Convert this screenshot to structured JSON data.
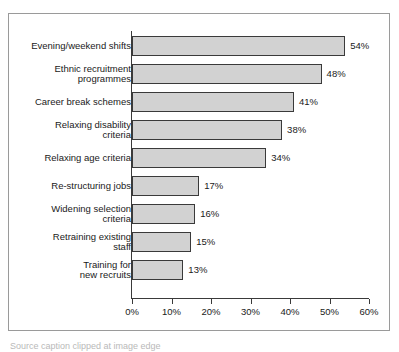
{
  "chart_data": {
    "type": "bar",
    "orientation": "horizontal",
    "title": "",
    "xlabel": "",
    "ylabel": "",
    "categories": [
      "Evening/weekend shifts",
      "Ethnic recruitment\nprogrammes",
      "Career break schemes",
      "Relaxing disability\ncriteria",
      "Relaxing age criteria",
      "Re-structuring jobs",
      "Widening selection\ncriteria",
      "Retraining existing\nstaff",
      "Training for\nnew recruits"
    ],
    "values": [
      54,
      48,
      41,
      38,
      34,
      17,
      16,
      15,
      13
    ],
    "value_labels": [
      "54%",
      "48%",
      "41%",
      "38%",
      "34%",
      "17%",
      "16%",
      "15%",
      "13%"
    ],
    "xlim": [
      0,
      60
    ],
    "xticks": [
      0,
      10,
      20,
      30,
      40,
      50,
      60
    ],
    "xtick_labels": [
      "0%",
      "10%",
      "20%",
      "30%",
      "40%",
      "50%",
      "60%"
    ],
    "grid": false,
    "legend": null,
    "bar_fill_color": "#d2d2d2",
    "bar_edge_color": "#3a3a3a",
    "axis_color": "#3a3a3a",
    "frame_color": "#9a9a9a",
    "background_color": "#ffffff"
  },
  "caption": {
    "text": "Source caption clipped at image edge"
  }
}
